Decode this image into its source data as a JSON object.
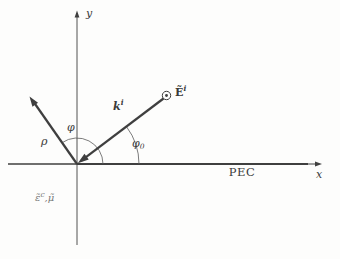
{
  "figure": {
    "title_hint": "plane wave obliquely incident on a PEC half-space",
    "colors": {
      "background": "#fdfdfc",
      "line": "#3f3f3f",
      "text": "#3a3a3a",
      "faint_text": "#787878"
    },
    "axes": {
      "x": "x",
      "y": "y"
    },
    "boundary": "PEC",
    "wave_vector": {
      "base": "k",
      "sup": "i"
    },
    "e_field": {
      "base": "Ẽ",
      "sup": "i"
    },
    "radial": "ρ",
    "angle_phi": "φ",
    "angle_phi0": {
      "base": "φ",
      "sub": "0"
    },
    "medium": {
      "eps": "ε̃",
      "eps_sup": "c",
      "rest": ",μ̃"
    }
  }
}
